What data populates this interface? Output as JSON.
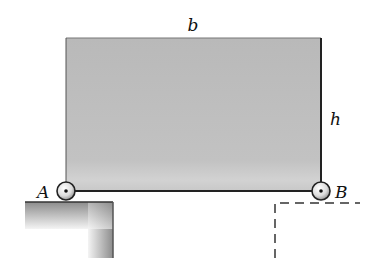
{
  "diagram": {
    "labels": {
      "width": "b",
      "height": "h",
      "left_support": "A",
      "right_support": "B"
    },
    "colors": {
      "plate_fill": "#bdbdbd",
      "plate_edge": "#222222",
      "ground_dark": "#8a8a8a",
      "ground_light": "#f2f2f2",
      "dashed_line": "#333333"
    },
    "elements": [
      {
        "type": "rectangular-plate",
        "label_top": "b",
        "label_side": "h"
      },
      {
        "type": "roller-support",
        "label": "A",
        "position": "bottom-left"
      },
      {
        "type": "roller-support",
        "label": "B",
        "position": "bottom-right"
      },
      {
        "type": "ground-ledge",
        "style": "solid-shaded",
        "under": "A"
      },
      {
        "type": "ground-ledge",
        "style": "dashed-outline",
        "under": "B"
      }
    ]
  }
}
